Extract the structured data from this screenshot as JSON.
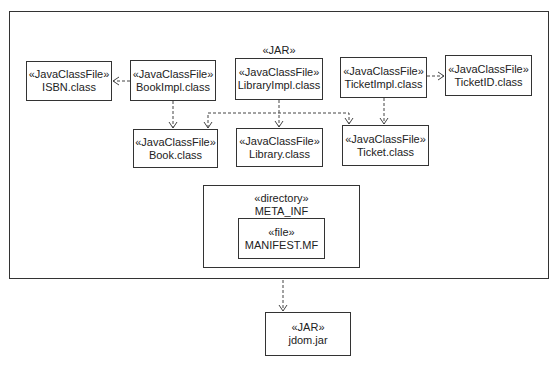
{
  "diagram": {
    "type": "UML deployment/artifact diagram",
    "outer_jar": {
      "stereotype": "«JAR»",
      "name": "librarySystem.jar"
    },
    "artifacts": {
      "isbn": {
        "stereotype": "«JavaClassFile»",
        "name": "ISBN.class"
      },
      "bookimpl": {
        "stereotype": "«JavaClassFile»",
        "name": "BookImpl.class"
      },
      "libraryimpl": {
        "stereotype": "«JavaClassFile»",
        "name": "LibraryImpl.class"
      },
      "ticketimpl": {
        "stereotype": "«JavaClassFile»",
        "name": "TicketImpl.class"
      },
      "ticketid": {
        "stereotype": "«JavaClassFile»",
        "name": "TicketID.class"
      },
      "book": {
        "stereotype": "«JavaClassFile»",
        "name": "Book.class"
      },
      "library": {
        "stereotype": "«JavaClassFile»",
        "name": "Library.class"
      },
      "ticket": {
        "stereotype": "«JavaClassFile»",
        "name": "Ticket.class"
      }
    },
    "directory": {
      "stereotype": "«directory»",
      "name": "META_INF"
    },
    "file": {
      "stereotype": "«file»",
      "name": "MANIFEST.MF"
    },
    "external_jar": {
      "stereotype": "«JAR»",
      "name": "jdom.jar"
    },
    "dependencies": [
      {
        "from": "BookImpl.class",
        "to": "ISBN.class"
      },
      {
        "from": "BookImpl.class",
        "to": "Book.class"
      },
      {
        "from": "LibraryImpl.class",
        "to": "Book.class"
      },
      {
        "from": "LibraryImpl.class",
        "to": "Library.class"
      },
      {
        "from": "LibraryImpl.class",
        "to": "Ticket.class"
      },
      {
        "from": "TicketImpl.class",
        "to": "TicketID.class"
      },
      {
        "from": "TicketImpl.class",
        "to": "Ticket.class"
      },
      {
        "from": "librarySystem.jar",
        "to": "jdom.jar"
      }
    ],
    "colors": {
      "line": "#333333",
      "background": "#ffffff",
      "text": "#222222"
    }
  }
}
